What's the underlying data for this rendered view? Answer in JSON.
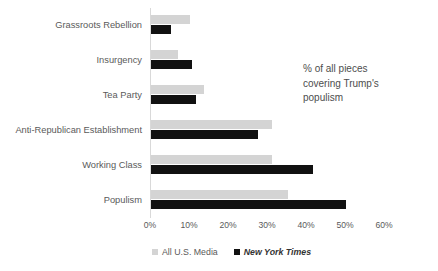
{
  "chart_data": {
    "type": "bar",
    "orientation": "horizontal",
    "title": "",
    "xlabel": "",
    "ylabel": "",
    "xlim": [
      0,
      60
    ],
    "xtick_labels": [
      "0%",
      "10%",
      "20%",
      "30%",
      "40%",
      "50%",
      "60%"
    ],
    "xtick_values": [
      0,
      10,
      20,
      30,
      40,
      50,
      60
    ],
    "grid": false,
    "legend_position": "bottom",
    "categories": [
      "Grassroots Rebellion",
      "Insurgency",
      "Tea Party",
      "Anti-Republican Establishment",
      "Working Class",
      "Populism"
    ],
    "series": [
      {
        "name": "All U.S. Media",
        "color": "#d4d4d4",
        "values": [
          10,
          7,
          13.5,
          31,
          31,
          35
        ]
      },
      {
        "name": "New York Times",
        "color": "#111111",
        "values": [
          5,
          10.5,
          11.5,
          27.5,
          41.5,
          50
        ]
      }
    ],
    "annotation": {
      "lines": [
        "% of all pieces",
        "covering Trump's",
        "populism"
      ]
    }
  }
}
